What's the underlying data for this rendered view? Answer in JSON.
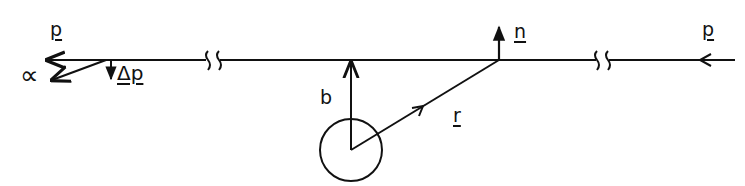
{
  "diagram": {
    "type": "scattering-geometry",
    "colors": {
      "ink": "#111111",
      "background": "#ffffff"
    },
    "labels": {
      "p_incoming": "p",
      "p_outgoing": "p",
      "alpha": "∝",
      "delta_p": "Δp",
      "impact_parameter": "b",
      "position_vector": "r",
      "normal": "n"
    },
    "elements": [
      "trajectory-line with two break marks",
      "incoming momentum arrow (right side, pointing left)",
      "outgoing momentum arrow (left side)",
      "deflected momentum arrow at angle alpha",
      "momentum change arrow delta p",
      "scattering center circle",
      "impact parameter vector b",
      "position vector r",
      "normal vector n"
    ]
  }
}
